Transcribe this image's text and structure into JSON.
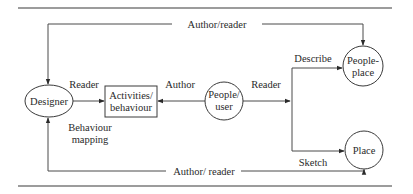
{
  "diagram": {
    "nodes": {
      "designer": {
        "label": "Designer",
        "shape": "ellipse"
      },
      "activities": {
        "line1": "Activities/",
        "line2": "behaviour",
        "shape": "rectangle"
      },
      "people_user": {
        "line1": "People/",
        "line2": "user",
        "shape": "circle"
      },
      "people_place": {
        "line1": "People-",
        "line2": "place",
        "shape": "circle"
      },
      "place": {
        "label": "Place",
        "shape": "circle"
      }
    },
    "edges": {
      "top_loop": {
        "label": "Author/reader",
        "from": "People-place",
        "to": "Designer"
      },
      "designer_to_activities": {
        "label": "Reader"
      },
      "people_to_activities": {
        "label": "Author"
      },
      "people_to_branch": {
        "label": "Reader"
      },
      "branch_to_people_place": {
        "label": "Describe"
      },
      "branch_to_place": {
        "label": "Sketch"
      },
      "bottom_loop": {
        "label": "Author/ reader",
        "from": "Place",
        "to": "Designer"
      }
    },
    "annotations": {
      "behaviour_mapping_line1": "Behaviour",
      "behaviour_mapping_line2": "mapping"
    },
    "colors": {
      "stroke": "#3a3a3a",
      "text": "#2a2a2a",
      "background": "#ffffff"
    }
  }
}
